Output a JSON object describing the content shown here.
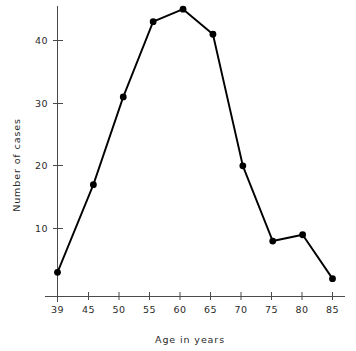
{
  "chart_data": {
    "type": "line",
    "title": "",
    "subtitle": "",
    "xlabel": "Age in years",
    "ylabel": "Number of cases",
    "x": [
      39,
      45,
      50,
      55,
      60,
      65,
      70,
      75,
      80,
      85
    ],
    "values": [
      3,
      17,
      31,
      43,
      45,
      41,
      20,
      8,
      9,
      2
    ],
    "categories": [
      "39",
      "45",
      "50",
      "55",
      "60",
      "65",
      "70",
      "75",
      "80",
      "85"
    ],
    "xticklabels": [
      "39",
      "45",
      "50",
      "55",
      "60",
      "65",
      "70",
      "75",
      "80",
      "85"
    ],
    "yticklabels": [
      "10",
      "20",
      "30",
      "40"
    ],
    "yticks": [
      10,
      20,
      30,
      40
    ],
    "xlim": [
      37,
      87
    ],
    "ylim": [
      0,
      47
    ],
    "grid": false,
    "legend": null,
    "marker": "filled-circle",
    "line_color": "#000000",
    "marker_color": "#000000",
    "background_color": "#ffffff",
    "annotations": []
  },
  "axes": {
    "y_axis_label": "Number of cases",
    "x_axis_label": "Age in years"
  }
}
